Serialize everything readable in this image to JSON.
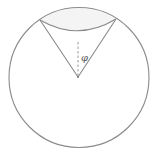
{
  "diagram": {
    "type": "geometry",
    "colors": {
      "stroke": "#8a8a8a",
      "cap_fill": "#f4f4f4",
      "dashed": "#9a9a9a",
      "background": "#ffffff"
    },
    "circle": {
      "cx": 79,
      "cy": 77.5,
      "r": 70
    },
    "apex": {
      "x": 78,
      "y": 77
    },
    "left_vertex": {
      "x": 40,
      "y": 20
    },
    "right_vertex": {
      "x": 116,
      "y": 19
    },
    "inner_arc_lowest_y": 30,
    "axis_dashed_line": {
      "x": 78,
      "y1": 42,
      "y2": 76
    },
    "angle_label": "φ"
  }
}
